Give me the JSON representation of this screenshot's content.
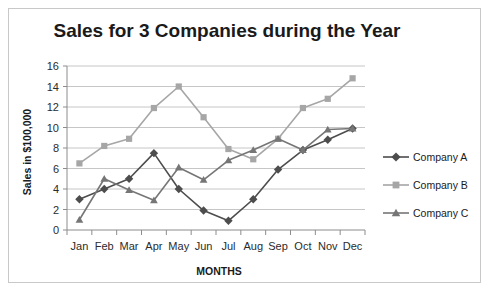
{
  "chart_data": {
    "type": "line",
    "title": "Sales for 3 Companies during the Year",
    "xlabel": "MONTHS",
    "ylabel": "Sales in $100,000",
    "categories": [
      "Jan",
      "Feb",
      "Mar",
      "Apr",
      "May",
      "Jun",
      "Jul",
      "Aug",
      "Sep",
      "Oct",
      "Nov",
      "Dec"
    ],
    "ylim": [
      0,
      16
    ],
    "ytick_step": 2,
    "yticks": [
      "0",
      "2",
      "4",
      "6",
      "8",
      "10",
      "12",
      "14",
      "16"
    ],
    "grid": true,
    "legend_position": "right",
    "series": [
      {
        "name": "Company A",
        "marker": "diamond",
        "color": "#4d4d4d",
        "values": [
          3,
          4,
          5,
          7.5,
          4,
          1.9,
          0.9,
          3,
          5.9,
          7.8,
          8.8,
          9.9
        ]
      },
      {
        "name": "Company B",
        "marker": "square",
        "color": "#a6a6a6",
        "values": [
          6.5,
          8.2,
          8.9,
          11.9,
          14,
          11,
          7.9,
          6.9,
          8.9,
          11.9,
          12.8,
          14.8
        ]
      },
      {
        "name": "Company C",
        "marker": "triangle",
        "color": "#767676",
        "values": [
          1,
          5,
          3.9,
          2.9,
          6.1,
          4.9,
          6.8,
          7.8,
          8.9,
          7.8,
          9.8,
          9.9
        ]
      }
    ]
  },
  "legend": {
    "items": [
      {
        "label": "Company A"
      },
      {
        "label": "Company B"
      },
      {
        "label": "Company C"
      }
    ]
  }
}
